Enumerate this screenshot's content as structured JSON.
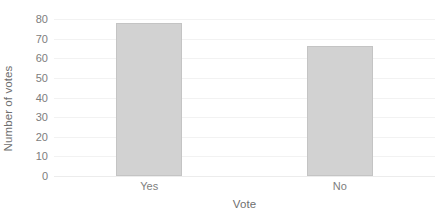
{
  "chart_data": {
    "type": "bar",
    "title": "",
    "categories": [
      "Yes",
      "No"
    ],
    "values": [
      78,
      66
    ],
    "series": [
      {
        "name": "Number of votes",
        "values": [
          78,
          66
        ]
      }
    ],
    "xlabel": "Vote",
    "ylabel": "Number of votes",
    "ylim": [
      0,
      80
    ],
    "ytick_step": 10,
    "yticks": [
      80,
      70,
      60,
      50,
      40,
      30,
      20,
      10,
      0
    ],
    "ytick_labels": [
      "80",
      "70",
      "60",
      "50",
      "40",
      "30",
      "20",
      "10",
      "0"
    ],
    "grid": true,
    "grid_axis": "y",
    "legend": false,
    "legend_position": "none",
    "bar_fill_color": "#d2d2d2",
    "bar_border_color": "#c4c4c4",
    "gridline_color": "#f2f2f2",
    "axis_label_color": "#6f6f6f",
    "tick_label_color": "#7d7d7d",
    "background_color": "#ffffff"
  }
}
